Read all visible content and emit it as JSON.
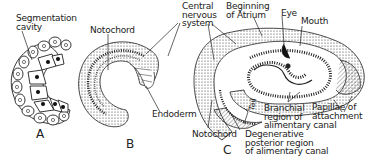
{
  "figure": {
    "panels": [
      {
        "id": "A",
        "letter": "A",
        "labels": [
          "Segmentation\ncavity"
        ]
      },
      {
        "id": "B",
        "letter": "B",
        "labels": [
          "Notochord",
          "Central\nnervous\nsystem",
          "Endoderm"
        ]
      },
      {
        "id": "C",
        "letter": "C",
        "labels": [
          "Beginning\nof Atrium",
          "Eye",
          "Mouth",
          "Branchial\nregion of\nalimentary canal",
          "Papillae of\nattachment",
          "Tail",
          "Notochord",
          "Degenerative\nposterior region\nof alimentary canal"
        ]
      }
    ]
  },
  "labels": {
    "a_seg": "Segmentation\ncavity",
    "a_letter": "A",
    "b_noto": "Notochord",
    "b_letter": "B",
    "b_cns": "Central\nnervous\nsystem",
    "b_endo": "Endoderm",
    "c_atrium": "Beginning\nof Atrium",
    "c_eye": "Eye",
    "c_mouth": "Mouth",
    "c_branchial": "Branchial\nregion of\nalimentary canal",
    "c_papillae": "Papillae of\nattachment",
    "c_tail": "Tail",
    "c_noto": "Notochord",
    "c_degen": "Degenerative\nposterior region\nof alimentary canal",
    "c_letter": "C"
  },
  "colors": {
    "ink": "#222222",
    "paper": "#ffffff"
  }
}
